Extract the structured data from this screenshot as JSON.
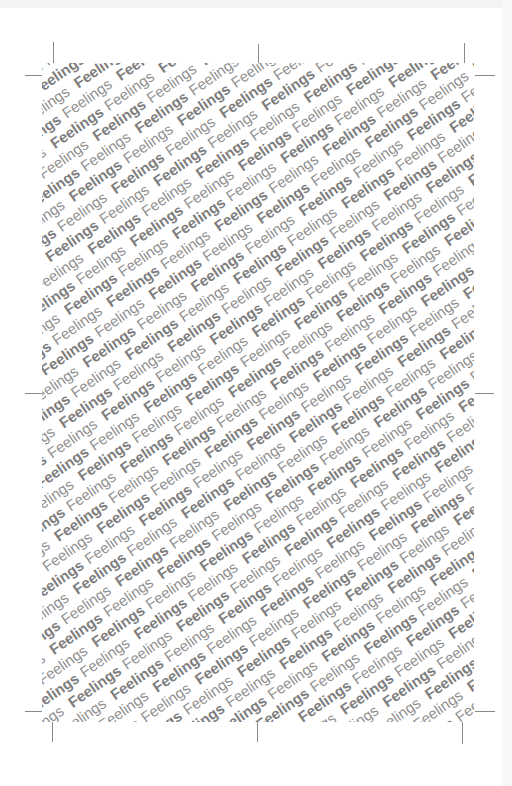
{
  "pattern": {
    "word": "Feelings",
    "weights": [
      "bold",
      "regular"
    ],
    "angle_deg": -35,
    "line_spacing_px": 18,
    "word_pitch_px": 66,
    "lines": 66,
    "words_per_line": 17,
    "colors": {
      "bold": "#7e7e7e",
      "regular": "#8f8f8f",
      "background": "#ffffff"
    }
  },
  "crop_marks": {
    "color": "#8a8a8a",
    "trim": {
      "left": 53,
      "top": 75,
      "right": 462,
      "bottom": 712
    }
  }
}
